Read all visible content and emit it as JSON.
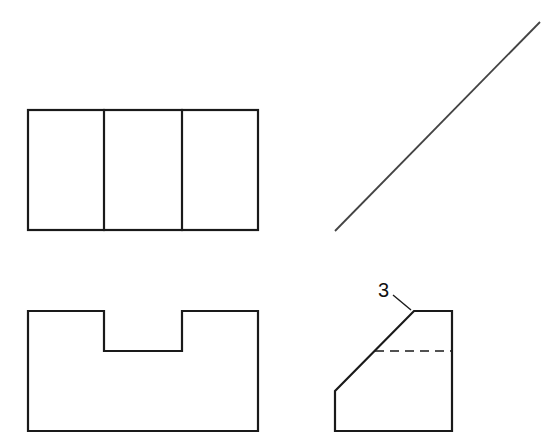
{
  "figure": {
    "colors": {
      "background": "#ffffff",
      "line": "#1a1a1a",
      "miter_line": "#444444"
    },
    "views": {
      "top_view": {
        "name": "Top view",
        "outline": [
          [
            28,
            110
          ],
          [
            258,
            110
          ],
          [
            258,
            230
          ],
          [
            28,
            230
          ]
        ],
        "dividers_x": [
          104,
          182
        ]
      },
      "front_view": {
        "name": "Front view",
        "outline": [
          [
            28,
            311
          ],
          [
            104,
            311
          ],
          [
            104,
            351
          ],
          [
            182,
            351
          ],
          [
            182,
            311
          ],
          [
            258,
            311
          ],
          [
            258,
            431
          ],
          [
            28,
            431
          ]
        ]
      },
      "miter_line": {
        "name": "45-degree miter line",
        "from": [
          335,
          231
        ],
        "to": [
          540,
          22
        ]
      },
      "side_view": {
        "name": "Side view",
        "outline": [
          [
            335,
            391
          ],
          [
            414,
            311
          ],
          [
            452,
            311
          ],
          [
            452,
            431
          ],
          [
            335,
            431
          ]
        ],
        "hidden_line": {
          "from": [
            375,
            351
          ],
          "to": [
            452,
            351
          ]
        }
      }
    },
    "annotations": [
      {
        "label": "3",
        "text_position": [
          378,
          297
        ],
        "leader_from": [
          393,
          295
        ],
        "leader_to": [
          411,
          310
        ]
      }
    ]
  }
}
